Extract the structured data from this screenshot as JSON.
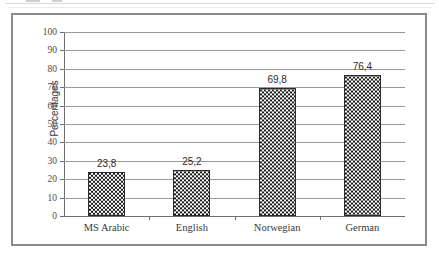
{
  "chart_data": {
    "type": "bar",
    "title": "",
    "xlabel": "",
    "ylabel": "Percentages",
    "categories": [
      "MS Arabic",
      "English",
      "Norwegian",
      "German"
    ],
    "values": [
      23.8,
      25.2,
      69.8,
      76.4
    ],
    "value_labels": [
      "23,8",
      "25,2",
      "69,8",
      "76,4"
    ],
    "ylim": [
      0,
      100
    ],
    "ytick_labels": [
      "0",
      "10",
      "20",
      "30",
      "40",
      "50",
      "60",
      "70",
      "80",
      "90",
      "100"
    ],
    "ytick_values": [
      0,
      10,
      20,
      30,
      40,
      50,
      60,
      70,
      80,
      90,
      100
    ],
    "grid": true,
    "legend": "none",
    "decimal_separator": ",",
    "series": [
      {
        "name": "Percentages",
        "values": [
          23.8,
          25.2,
          69.8,
          76.4
        ],
        "fill": "checkerboard",
        "fill_colors": [
          "#1a1a1a",
          "#ffffff"
        ],
        "border_color": "#2a2a2a"
      }
    ]
  },
  "style": {
    "frame_border_color": "#8a8a8a",
    "gridline_color": "#9a9a9a",
    "axis_color": "#6f6f6f",
    "background": "#ffffff",
    "label_color": "#3a3a3a"
  }
}
